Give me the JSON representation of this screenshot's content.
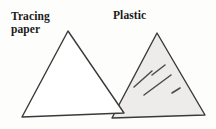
{
  "figure": {
    "background_color": "#fdfdfc",
    "width": 216,
    "height": 129,
    "stroke_color": "#3a3a3a",
    "labels": {
      "tracing_paper": "Tracing\npaper",
      "plastic": "Plastic"
    },
    "shapes": [
      {
        "name": "tracing-paper-triangle",
        "label": "Tracing paper",
        "fill": "#ffffff",
        "fill_description": "unfilled / white, transparent paper",
        "stroke": "#3a3a3a",
        "stroke_width": 1.4,
        "points": "68,31 124,113 22,117"
      },
      {
        "name": "plastic-triangle",
        "label": "Plastic",
        "fill": "#edecea",
        "fill_description": "light grey translucent shading",
        "stroke": "#3a3a3a",
        "stroke_width": 1.4,
        "points": "157,33 205,115 112,118"
      }
    ],
    "shine_marks": {
      "name": "plastic-shine-lines",
      "count": 4,
      "color": "#4a4a4a",
      "lines": [
        {
          "x1": 165,
          "y1": 65,
          "x2": 152,
          "y2": 75
        },
        {
          "x1": 152,
          "y1": 71,
          "x2": 134,
          "y2": 87
        },
        {
          "x1": 171,
          "y1": 75,
          "x2": 144,
          "y2": 95
        },
        {
          "x1": 180,
          "y1": 88,
          "x2": 172,
          "y2": 93
        }
      ]
    }
  }
}
